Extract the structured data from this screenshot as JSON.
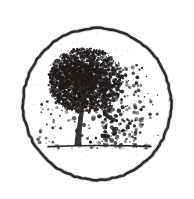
{
  "image": {
    "kind": "scanned-ink-emblem",
    "subject": "windblown-tree-in-circle",
    "width": 194,
    "height": 199,
    "background_color": "#ffffff",
    "ink_color": "#231f1e",
    "ink_color_light": "#5c5552",
    "description": "Black ink stipple drawing of a leafy tree standing on a ground line, leaves scattering to the right as if blown by wind, enclosed in a hand-drawn circular outline."
  },
  "circle": {
    "name": "circular-border",
    "center_x": 97,
    "center_y": 104,
    "radius_x": 74,
    "radius_y": 76,
    "stroke_width": 2.6,
    "stroke_color": "#231f1e",
    "rotation_deg": -3
  },
  "ground": {
    "name": "ground-line",
    "x_start": 48,
    "x_end": 151,
    "y": 146,
    "thickness": 1.6,
    "color": "#2b2725",
    "speckle_count": 40
  },
  "trunk": {
    "name": "tree-trunk",
    "base_x": 78,
    "base_y": 146,
    "top_x": 83,
    "top_y": 96,
    "base_width": 7,
    "top_width": 2.4,
    "color": "#2a2523",
    "branches": [
      {
        "x1": 82,
        "y1": 108,
        "x2": 68,
        "y2": 92,
        "w": 1.8
      },
      {
        "x1": 82,
        "y1": 104,
        "x2": 96,
        "y2": 88,
        "w": 1.8
      },
      {
        "x1": 83,
        "y1": 100,
        "x2": 78,
        "y2": 78,
        "w": 1.6
      },
      {
        "x1": 83,
        "y1": 99,
        "x2": 93,
        "y2": 80,
        "w": 1.4
      },
      {
        "x1": 81,
        "y1": 112,
        "x2": 62,
        "y2": 104,
        "w": 1.3
      },
      {
        "x1": 82,
        "y1": 106,
        "x2": 104,
        "y2": 100,
        "w": 1.2
      }
    ]
  },
  "canopy": {
    "name": "tree-canopy",
    "center_x": 88,
    "center_y": 83,
    "radius_x": 37,
    "radius_y": 32,
    "dot_count": 2600,
    "dot_min_r": 0.5,
    "dot_max_r": 2.5,
    "color": "#201c1b",
    "density_bias_x": -0.12,
    "density_bias_y": -0.15
  },
  "scatter": {
    "name": "windblown-leaves",
    "count": 240,
    "x_start": 104,
    "x_end": 158,
    "y_top": 64,
    "y_bottom": 146,
    "dot_min_r": 0.7,
    "dot_max_r": 2.6,
    "color": "#242020"
  },
  "scatter_left": {
    "name": "stray-leaves-left",
    "count": 34,
    "x_start": 36,
    "x_end": 74,
    "y_top": 100,
    "y_bottom": 144,
    "dot_min_r": 0.6,
    "dot_max_r": 1.9,
    "color": "#2c2726"
  },
  "scatter_below": {
    "name": "fallen-leaves",
    "count": 60,
    "x_start": 74,
    "x_end": 142,
    "y_top": 116,
    "y_bottom": 144,
    "dot_min_r": 0.7,
    "dot_max_r": 2.4,
    "color": "#221e1d"
  },
  "noise": {
    "name": "scan-grain",
    "count": 320,
    "color": "#8d8785",
    "opacity": 0.45
  },
  "random_seed": 20240517
}
